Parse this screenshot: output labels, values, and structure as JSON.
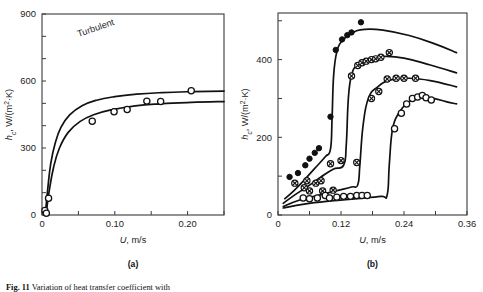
{
  "figure": {
    "caption_prefix": "Fig. 11",
    "caption_text": "Variation of heat transfer coefficient with",
    "panel_a_label": "(a)",
    "panel_b_label": "(b)"
  },
  "chart_data": [
    {
      "id": "panel-a",
      "type": "scatter",
      "title": "",
      "annotation": "Turbulent",
      "xlabel": "U, m/s",
      "ylabel": "h_c, W/(m²·K)",
      "ylabel_parts": {
        "italic": "h",
        "sub": "c",
        "rest": ", W/(m",
        "sup": "2",
        "tail": "·K)"
      },
      "xlim": [
        0,
        0.25
      ],
      "ylim": [
        0,
        900
      ],
      "xticks": [
        0,
        0.05,
        0.1,
        0.15,
        0.2,
        0.25
      ],
      "xtick_labels": [
        "0",
        "",
        "0.10",
        "",
        "0.20",
        ""
      ],
      "yticks": [
        0,
        100,
        200,
        300,
        400,
        500,
        600,
        700,
        800,
        900
      ],
      "ytick_labels": [
        "0",
        "",
        "",
        "300",
        "",
        "",
        "600",
        "",
        "",
        "900"
      ],
      "grid": false,
      "legend": "none",
      "series": [
        {
          "name": "data-points-open",
          "marker": "open-circle",
          "points": [
            [
              0.004,
              20
            ],
            [
              0.006,
              8
            ],
            [
              0.009,
              75
            ],
            [
              0.069,
              420
            ],
            [
              0.099,
              462
            ],
            [
              0.117,
              472
            ],
            [
              0.144,
              510
            ],
            [
              0.163,
              508
            ],
            [
              0.205,
              556
            ]
          ]
        },
        {
          "name": "curve-upper",
          "marker": "none",
          "curve": [
            [
              0.0045,
              0
            ],
            [
              0.008,
              120
            ],
            [
              0.012,
              230
            ],
            [
              0.018,
              320
            ],
            [
              0.026,
              392
            ],
            [
              0.038,
              448
            ],
            [
              0.055,
              489
            ],
            [
              0.075,
              514
            ],
            [
              0.1,
              530
            ],
            [
              0.13,
              541
            ],
            [
              0.165,
              548
            ],
            [
              0.2,
              552
            ],
            [
              0.25,
              555
            ]
          ]
        },
        {
          "name": "curve-lower",
          "marker": "none",
          "curve": [
            [
              0.0055,
              0
            ],
            [
              0.01,
              110
            ],
            [
              0.016,
              215
            ],
            [
              0.024,
              300
            ],
            [
              0.036,
              370
            ],
            [
              0.052,
              418
            ],
            [
              0.072,
              450
            ],
            [
              0.097,
              472
            ],
            [
              0.128,
              489
            ],
            [
              0.163,
              498
            ],
            [
              0.205,
              504
            ],
            [
              0.25,
              508
            ]
          ]
        }
      ]
    },
    {
      "id": "panel-b",
      "type": "scatter",
      "title": "",
      "annotation": "",
      "xlabel": "U, m/s",
      "ylabel": "h_c, W/(m²·K)",
      "xlim": [
        0,
        0.36
      ],
      "ylim": [
        0,
        520
      ],
      "xticks": [
        0,
        0.06,
        0.12,
        0.18,
        0.24,
        0.3,
        0.36
      ],
      "xtick_labels": [
        "0",
        "",
        "0.12",
        "",
        "0.24",
        "",
        "0.36"
      ],
      "yticks": [
        0,
        100,
        200,
        300,
        400,
        500
      ],
      "ytick_labels": [
        "0",
        "",
        "200",
        "",
        "400",
        ""
      ],
      "grid": false,
      "legend": "none",
      "series": [
        {
          "name": "series-filled",
          "marker": "filled-circle",
          "points": [
            [
              0.022,
              98
            ],
            [
              0.038,
              108
            ],
            [
              0.052,
              128
            ],
            [
              0.06,
              145
            ],
            [
              0.07,
              160
            ],
            [
              0.078,
              172
            ],
            [
              0.1,
              253
            ],
            [
              0.11,
              425
            ],
            [
              0.122,
              452
            ],
            [
              0.132,
              463
            ],
            [
              0.14,
              470
            ],
            [
              0.158,
              496
            ]
          ],
          "curve": [
            [
              0.013,
              42
            ],
            [
              0.03,
              62
            ],
            [
              0.05,
              90
            ],
            [
              0.07,
              120
            ],
            [
              0.09,
              150
            ],
            [
              0.1,
              170
            ],
            [
              0.103,
              250
            ],
            [
              0.106,
              360
            ],
            [
              0.112,
              420
            ],
            [
              0.122,
              448
            ],
            [
              0.14,
              468
            ],
            [
              0.165,
              478
            ],
            [
              0.2,
              476
            ],
            [
              0.25,
              462
            ],
            [
              0.3,
              440
            ],
            [
              0.34,
              418
            ]
          ]
        },
        {
          "name": "series-crossed-upper",
          "marker": "crossed-circle",
          "points": [
            [
              0.032,
              82
            ],
            [
              0.05,
              70
            ],
            [
              0.055,
              88
            ],
            [
              0.072,
              82
            ],
            [
              0.082,
              88
            ],
            [
              0.1,
              132
            ],
            [
              0.12,
              140
            ],
            [
              0.14,
              358
            ],
            [
              0.152,
              385
            ],
            [
              0.16,
              392
            ],
            [
              0.168,
              396
            ],
            [
              0.178,
              400
            ],
            [
              0.186,
              402
            ],
            [
              0.196,
              406
            ],
            [
              0.212,
              418
            ]
          ],
          "curve": [
            [
              0.01,
              30
            ],
            [
              0.03,
              50
            ],
            [
              0.055,
              72
            ],
            [
              0.08,
              96
            ],
            [
              0.105,
              118
            ],
            [
              0.125,
              128
            ],
            [
              0.13,
              180
            ],
            [
              0.134,
              300
            ],
            [
              0.14,
              360
            ],
            [
              0.152,
              388
            ],
            [
              0.17,
              400
            ],
            [
              0.2,
              408
            ],
            [
              0.24,
              404
            ],
            [
              0.29,
              386
            ],
            [
              0.34,
              366
            ]
          ]
        },
        {
          "name": "series-crossed-lower",
          "marker": "crossed-circle",
          "points": [
            [
              0.06,
              62
            ],
            [
              0.085,
              62
            ],
            [
              0.105,
              64
            ],
            [
              0.15,
              135
            ],
            [
              0.178,
              300
            ],
            [
              0.192,
              318
            ],
            [
              0.208,
              350
            ],
            [
              0.225,
              352
            ],
            [
              0.24,
              352
            ],
            [
              0.262,
              352
            ]
          ],
          "curve": [
            [
              0.01,
              22
            ],
            [
              0.04,
              38
            ],
            [
              0.075,
              50
            ],
            [
              0.11,
              62
            ],
            [
              0.14,
              72
            ],
            [
              0.152,
              78
            ],
            [
              0.156,
              130
            ],
            [
              0.162,
              230
            ],
            [
              0.172,
              300
            ],
            [
              0.19,
              330
            ],
            [
              0.215,
              348
            ],
            [
              0.25,
              352
            ],
            [
              0.29,
              346
            ],
            [
              0.34,
              330
            ]
          ]
        },
        {
          "name": "series-open",
          "marker": "open-circle",
          "points": [
            [
              0.048,
              44
            ],
            [
              0.06,
              42
            ],
            [
              0.075,
              44
            ],
            [
              0.09,
              50
            ],
            [
              0.098,
              44
            ],
            [
              0.112,
              46
            ],
            [
              0.125,
              48
            ],
            [
              0.138,
              48
            ],
            [
              0.15,
              50
            ],
            [
              0.16,
              50
            ],
            [
              0.17,
              50
            ],
            [
              0.222,
              222
            ],
            [
              0.235,
              262
            ],
            [
              0.245,
              286
            ],
            [
              0.256,
              300
            ],
            [
              0.266,
              304
            ],
            [
              0.275,
              308
            ],
            [
              0.282,
              302
            ],
            [
              0.292,
              296
            ]
          ],
          "curve": [
            [
              0.01,
              18
            ],
            [
              0.05,
              28
            ],
            [
              0.1,
              36
            ],
            [
              0.15,
              42
            ],
            [
              0.196,
              48
            ],
            [
              0.208,
              52
            ],
            [
              0.212,
              130
            ],
            [
              0.218,
              220
            ],
            [
              0.23,
              262
            ],
            [
              0.248,
              290
            ],
            [
              0.27,
              302
            ],
            [
              0.295,
              300
            ],
            [
              0.32,
              292
            ],
            [
              0.34,
              286
            ]
          ]
        }
      ]
    }
  ]
}
